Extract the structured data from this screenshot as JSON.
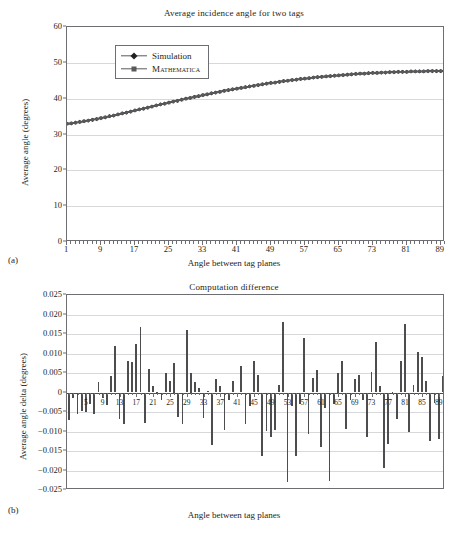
{
  "figure": {
    "panel_a_label": "(a)",
    "panel_b_label": "(b)"
  },
  "chart_data": [
    {
      "id": "panel-a",
      "type": "line",
      "title": "Average incidence angle for two tags",
      "xlabel": "Angle between tag planes",
      "ylabel": "Average angle (degrees)",
      "xlim": [
        1,
        90
      ],
      "ylim": [
        0,
        60
      ],
      "yticks": [
        0,
        10,
        20,
        30,
        40,
        50,
        60
      ],
      "xticks": [
        1,
        9,
        17,
        25,
        33,
        41,
        49,
        57,
        65,
        73,
        81,
        89
      ],
      "grid": true,
      "legend_position": "upper-left-inset",
      "series": [
        {
          "name": "Simulation",
          "marker": "diamond",
          "color": "#231f20",
          "x": [
            1,
            2,
            3,
            4,
            5,
            6,
            7,
            8,
            9,
            10,
            11,
            12,
            13,
            14,
            15,
            16,
            17,
            18,
            19,
            20,
            21,
            22,
            23,
            24,
            25,
            26,
            27,
            28,
            29,
            30,
            31,
            32,
            33,
            34,
            35,
            36,
            37,
            38,
            39,
            40,
            41,
            42,
            43,
            44,
            45,
            46,
            47,
            48,
            49,
            50,
            51,
            52,
            53,
            54,
            55,
            56,
            57,
            58,
            59,
            60,
            61,
            62,
            63,
            64,
            65,
            66,
            67,
            68,
            69,
            70,
            71,
            72,
            73,
            74,
            75,
            76,
            77,
            78,
            79,
            80,
            81,
            82,
            83,
            84,
            85,
            86,
            87,
            88,
            89,
            90
          ],
          "values": [
            33.0,
            33.1,
            33.3,
            33.5,
            33.7,
            33.9,
            34.1,
            34.3,
            34.6,
            34.8,
            35.1,
            35.3,
            35.6,
            35.9,
            36.1,
            36.4,
            36.7,
            37.0,
            37.2,
            37.5,
            37.8,
            38.1,
            38.4,
            38.6,
            38.9,
            39.2,
            39.4,
            39.7,
            40.0,
            40.2,
            40.5,
            40.7,
            41.0,
            41.2,
            41.5,
            41.7,
            41.9,
            42.2,
            42.4,
            42.6,
            42.8,
            43.0,
            43.2,
            43.4,
            43.6,
            43.8,
            44.0,
            44.2,
            44.4,
            44.5,
            44.7,
            44.9,
            45.0,
            45.2,
            45.3,
            45.5,
            45.6,
            45.7,
            45.9,
            46.0,
            46.1,
            46.2,
            46.3,
            46.4,
            46.5,
            46.6,
            46.7,
            46.8,
            46.9,
            47.0,
            47.0,
            47.1,
            47.2,
            47.2,
            47.3,
            47.3,
            47.4,
            47.4,
            47.5,
            47.5,
            47.5,
            47.6,
            47.6,
            47.6,
            47.6,
            47.7,
            47.7,
            47.7,
            47.7,
            47.7
          ]
        },
        {
          "name": "Mathematica",
          "marker": "square",
          "color": "#58595b",
          "x": [
            1,
            2,
            3,
            4,
            5,
            6,
            7,
            8,
            9,
            10,
            11,
            12,
            13,
            14,
            15,
            16,
            17,
            18,
            19,
            20,
            21,
            22,
            23,
            24,
            25,
            26,
            27,
            28,
            29,
            30,
            31,
            32,
            33,
            34,
            35,
            36,
            37,
            38,
            39,
            40,
            41,
            42,
            43,
            44,
            45,
            46,
            47,
            48,
            49,
            50,
            51,
            52,
            53,
            54,
            55,
            56,
            57,
            58,
            59,
            60,
            61,
            62,
            63,
            64,
            65,
            66,
            67,
            68,
            69,
            70,
            71,
            72,
            73,
            74,
            75,
            76,
            77,
            78,
            79,
            80,
            81,
            82,
            83,
            84,
            85,
            86,
            87,
            88,
            89,
            90
          ],
          "values": [
            33.007,
            33.108,
            33.288,
            33.495,
            33.704,
            33.892,
            34.108,
            34.31,
            34.588,
            34.812,
            35.084,
            35.312,
            35.584,
            35.884,
            36.116,
            36.392,
            36.688,
            36.984,
            37.204,
            37.496,
            37.792,
            38.092,
            38.392,
            38.604,
            38.884,
            39.184,
            39.396,
            39.704,
            39.996,
            40.204,
            40.496,
            40.704,
            41.013,
            41.212,
            41.488,
            41.704,
            41.904,
            42.192,
            42.392,
            42.608,
            42.8,
            43.007,
            43.192,
            43.392,
            43.592,
            43.816,
            44.016,
            44.192,
            44.384,
            44.498,
            44.682,
            44.923,
            45.023,
            45.214,
            45.323,
            45.514,
            45.614,
            45.714,
            45.914,
            46.014,
            46.123,
            46.214,
            46.3,
            46.4,
            46.495,
            46.592,
            46.692,
            46.792,
            46.892,
            47.009,
            46.987,
            47.087,
            47.187,
            47.183,
            47.283,
            47.319,
            47.381,
            47.413,
            47.49,
            47.51,
            47.482,
            47.59,
            47.59,
            47.61,
            47.61,
            47.688,
            47.712,
            47.688,
            47.7,
            47.704
          ]
        }
      ]
    },
    {
      "id": "panel-b",
      "type": "bar",
      "title": "Computation difference",
      "xlabel": "Angle between tag planes",
      "ylabel": "Average angle delta (degrees)",
      "xlim": [
        1,
        90
      ],
      "ylim": [
        -0.025,
        0.025
      ],
      "yticks": [
        0.025,
        0.02,
        0.015,
        0.01,
        0.005,
        0,
        -0.005,
        -0.01,
        -0.015,
        -0.02,
        -0.025
      ],
      "ytick_labels": [
        "0.025",
        "0.020",
        "0.015",
        "0.010",
        "0.005",
        "0",
        "−0.005",
        "−0.010",
        "−0.015",
        "−0.020",
        "−0.025"
      ],
      "xticks": [
        5,
        9,
        13,
        17,
        21,
        25,
        29,
        33,
        37,
        41,
        45,
        49,
        53,
        57,
        61,
        65,
        69,
        73,
        77,
        81,
        85,
        89
      ],
      "grid": true,
      "categories": [
        1,
        2,
        3,
        4,
        5,
        6,
        7,
        8,
        9,
        10,
        11,
        12,
        13,
        14,
        15,
        16,
        17,
        18,
        19,
        20,
        21,
        22,
        23,
        24,
        25,
        26,
        27,
        28,
        29,
        30,
        31,
        32,
        33,
        34,
        35,
        36,
        37,
        38,
        39,
        40,
        41,
        42,
        43,
        44,
        45,
        46,
        47,
        48,
        49,
        50,
        51,
        52,
        53,
        54,
        55,
        56,
        57,
        58,
        59,
        60,
        61,
        62,
        63,
        64,
        65,
        66,
        67,
        68,
        69,
        70,
        71,
        72,
        73,
        74,
        75,
        76,
        77,
        78,
        79,
        80,
        81,
        82,
        83,
        84,
        85,
        86,
        87,
        88,
        89,
        90
      ],
      "values": [
        -0.007,
        -0.0015,
        -0.0055,
        -0.0048,
        -0.005,
        -0.003,
        -0.0055,
        0.0027,
        -0.0015,
        -0.0032,
        0.0042,
        0.0119,
        -0.0068,
        -0.008,
        0.008,
        0.0078,
        0.0124,
        0.0168,
        -0.0079,
        0.006,
        0.0016,
        0.0002,
        -0.002,
        0.0049,
        0.003,
        0.0075,
        -0.0063,
        -0.008,
        0.0161,
        0.005,
        0.0026,
        0.0012,
        -0.0065,
        0.0005,
        -0.0135,
        0.0035,
        0.0016,
        -0.0095,
        -0.002,
        0.0029,
        -0.0005,
        0.0067,
        -0.008,
        -0.0035,
        0.0082,
        0.0045,
        -0.0163,
        -0.0099,
        -0.0113,
        -0.0096,
        0.0018,
        0.018,
        -0.023,
        -0.0035,
        -0.0162,
        -0.003,
        0.014,
        -0.0106,
        0.0036,
        0.0058,
        -0.014,
        -0.004,
        -0.0227,
        -0.003,
        0.005,
        0.0082,
        -0.0094,
        -0.002,
        0.0035,
        0.0046,
        -0.002,
        -0.0115,
        0.0053,
        0.013,
        0.0016,
        -0.0194,
        -0.0131,
        0.0002,
        -0.0067,
        0.0082,
        0.0176,
        -0.0102,
        0.002,
        0.0105,
        0.009,
        0.0029,
        -0.0124,
        -0.0026,
        -0.0118,
        0.0043
      ]
    }
  ]
}
